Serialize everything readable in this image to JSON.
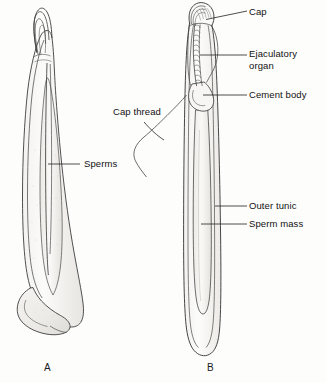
{
  "figure": {
    "background_color": "#fdfdfc",
    "ink_color": "#3a3a3a",
    "label_color": "#111111",
    "panels": [
      {
        "id": "A",
        "caption": "A",
        "x": 44,
        "y": 364
      },
      {
        "id": "B",
        "caption": "B",
        "x": 207,
        "y": 364
      }
    ],
    "labels": [
      {
        "name": "cap",
        "text": "Cap",
        "x": 249,
        "y": 7,
        "panel": "B"
      },
      {
        "name": "ejaculatory-organ",
        "text": "Ejaculatory\norgan",
        "x": 249,
        "y": 49,
        "panel": "B"
      },
      {
        "name": "cement-body",
        "text": "Cement body",
        "x": 249,
        "y": 90,
        "panel": "B"
      },
      {
        "name": "cap-thread",
        "text": "Cap thread",
        "x": 113,
        "y": 107,
        "panel": "B"
      },
      {
        "name": "outer-tunic",
        "text": "Outer tunic",
        "x": 249,
        "y": 201,
        "panel": "B"
      },
      {
        "name": "sperm-mass",
        "text": "Sperm mass",
        "x": 249,
        "y": 219,
        "panel": "B"
      },
      {
        "name": "sperms",
        "text": "Sperms",
        "x": 84,
        "y": 159,
        "panel": "A"
      }
    ]
  }
}
